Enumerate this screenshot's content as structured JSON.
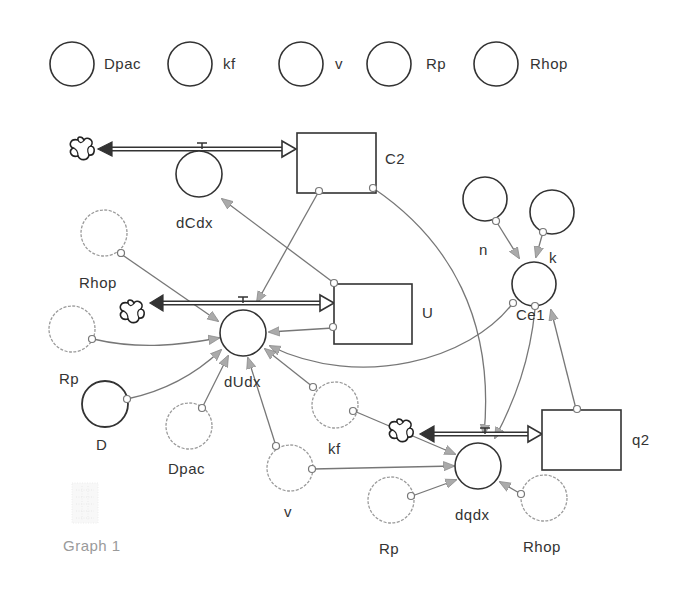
{
  "diagram": {
    "colors": {
      "stroke": "#222222",
      "ghost": "#9a9a9a",
      "link": "#777777",
      "arrowhead": "#aaaaaa",
      "background": "#ffffff"
    },
    "palette_converters": [
      {
        "label": "Dpac"
      },
      {
        "label": "kf"
      },
      {
        "label": "v"
      },
      {
        "label": "Rp"
      },
      {
        "label": "Rhop"
      }
    ],
    "stocks": [
      {
        "id": "C2",
        "label": "C2"
      },
      {
        "id": "U",
        "label": "U"
      },
      {
        "id": "q2",
        "label": "q2"
      }
    ],
    "flows": [
      {
        "id": "dCdx",
        "label": "dCdx",
        "into": "C2"
      },
      {
        "id": "dUdx",
        "label": "dUdx",
        "into": "U"
      },
      {
        "id": "dqdx",
        "label": "dqdx",
        "into": "q2"
      }
    ],
    "converters": [
      {
        "id": "n",
        "label": "n"
      },
      {
        "id": "k",
        "label": "k"
      },
      {
        "id": "Ce1",
        "label": "Ce1"
      },
      {
        "id": "D",
        "label": "D"
      }
    ],
    "ghosts": [
      {
        "id": "Rhop_a",
        "label": "Rhop"
      },
      {
        "id": "Rp_a",
        "label": "Rp"
      },
      {
        "id": "Dpac_a",
        "label": "Dpac"
      },
      {
        "id": "v_a",
        "label": "v"
      },
      {
        "id": "kf_a",
        "label": "kf"
      },
      {
        "id": "Rp_b",
        "label": "Rp"
      },
      {
        "id": "Rhop_b",
        "label": "Rhop"
      }
    ],
    "links": [
      {
        "from": "U",
        "to": "dCdx"
      },
      {
        "from": "C2",
        "to": "dUdx"
      },
      {
        "from": "C2",
        "to": "dqdx"
      },
      {
        "from": "U",
        "to": "dUdx"
      },
      {
        "from": "Ce1",
        "to": "dUdx"
      },
      {
        "from": "Rhop",
        "to": "dUdx"
      },
      {
        "from": "Rp",
        "to": "dUdx"
      },
      {
        "from": "D",
        "to": "dUdx"
      },
      {
        "from": "Dpac",
        "to": "dUdx"
      },
      {
        "from": "v",
        "to": "dUdx"
      },
      {
        "from": "kf",
        "to": "dUdx"
      },
      {
        "from": "kf",
        "to": "dqdx"
      },
      {
        "from": "v",
        "to": "dqdx"
      },
      {
        "from": "Rp",
        "to": "dqdx"
      },
      {
        "from": "Rhop",
        "to": "dqdx"
      },
      {
        "from": "Ce1",
        "to": "dqdx"
      },
      {
        "from": "n",
        "to": "Ce1"
      },
      {
        "from": "k",
        "to": "Ce1"
      },
      {
        "from": "q2",
        "to": "Ce1"
      }
    ],
    "graph_pad": {
      "label": "Graph 1"
    }
  }
}
